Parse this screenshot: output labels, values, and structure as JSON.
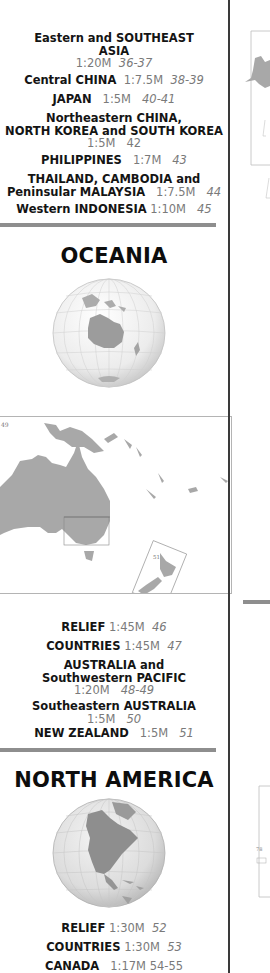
{
  "asia_entries": [
    {
      "title_lines": [
        "Eastern and SOUTHEAST",
        "ASIA"
      ],
      "scale": "1:20M",
      "pages": "36-37",
      "scale_newline": true
    },
    {
      "title_lines": [
        "Central CHINA"
      ],
      "scale": "1:7.5M",
      "pages": "38-39",
      "scale_newline": false
    },
    {
      "title_lines": [
        "JAPAN"
      ],
      "scale": "1:5M",
      "pages": "40-41",
      "scale_newline": false
    },
    {
      "title_lines": [
        "Northeastern CHINA,",
        "NORTH KOREA and SOUTH KOREA"
      ],
      "scale": "1:5M",
      "pages": "42",
      "scale_newline": true
    },
    {
      "title_lines": [
        "PHILIPPINES"
      ],
      "scale": "1:7M",
      "pages": "43",
      "scale_newline": false
    },
    {
      "title_lines": [
        "THAILAND, CAMBODIA and",
        "Peninsular MALAYSIA"
      ],
      "scale": "1:7.5M",
      "pages": "44",
      "scale_newline": false
    },
    {
      "title_lines": [
        "Western INDONESIA"
      ],
      "scale": "1:10M",
      "pages": "45",
      "scale_newline": false
    }
  ],
  "oceania": {
    "title": "OCEANIA",
    "globe_icon": "globe-oceania",
    "map_label_left": "49",
    "map_label_inset": "51",
    "entries": [
      {
        "title_lines": [
          "RELIEF"
        ],
        "scale": "1:45M",
        "pages": "46",
        "scale_newline": false
      },
      {
        "title_lines": [
          "COUNTRIES"
        ],
        "scale": "1:45M",
        "pages": "47",
        "scale_newline": false
      },
      {
        "title_lines": [
          "AUSTRALIA and",
          "Southwestern PACIFIC"
        ],
        "scale": "1:20M",
        "pages": "48-49",
        "scale_newline": true
      },
      {
        "title_lines": [
          "Southeastern AUSTRALIA"
        ],
        "scale": "1:5M",
        "pages": "50",
        "scale_newline": true
      },
      {
        "title_lines": [
          "NEW ZEALAND"
        ],
        "scale": "1:5M",
        "pages": "51",
        "scale_newline": false
      }
    ]
  },
  "north_america": {
    "title": "NORTH AMERICA",
    "globe_icon": "globe-north-america",
    "entries": [
      {
        "title_lines": [
          "RELIEF"
        ],
        "scale": "1:30M",
        "pages": "52",
        "scale_newline": false
      },
      {
        "title_lines": [
          "COUNTRIES"
        ],
        "scale": "1:30M",
        "pages": "53",
        "scale_newline": false
      },
      {
        "title_lines": [
          "CANADA"
        ],
        "scale": "1:17M",
        "pages": "54-55",
        "scale_newline": false
      }
    ]
  },
  "right_strip": {
    "page_label": "78"
  },
  "colors": {
    "divider": "#8e8e8e",
    "land": "#a8a8a8",
    "muted_text": "#7a7a7a",
    "rule": "#3a3a3a"
  }
}
